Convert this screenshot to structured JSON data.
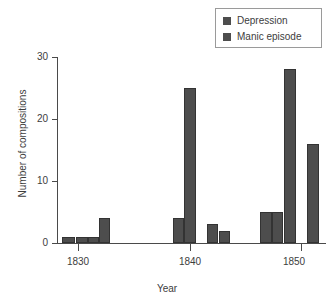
{
  "chart_data": {
    "type": "bar",
    "title": "",
    "xlabel": "Year",
    "ylabel": "Number of compositions",
    "xlim": [
      1828,
      1855
    ],
    "ylim": [
      0,
      30
    ],
    "yticks": [
      0,
      10,
      20,
      30
    ],
    "ytick_labels": [
      "0",
      "10",
      "20",
      "30"
    ],
    "xticks": [
      1830,
      1840,
      1850
    ],
    "xtick_labels": [
      "1830",
      "1840",
      "1850"
    ],
    "grid": false,
    "legend_position": "top-right",
    "legend": [
      "Depression",
      "Manic episode"
    ],
    "series": [
      {
        "name": "Depression",
        "color": "#4d4d4d",
        "points": [
          {
            "x": 1829,
            "value": 1
          },
          {
            "x": 1830,
            "value": 1
          },
          {
            "x": 1831,
            "value": 1
          },
          {
            "x": 1839,
            "value": 4
          },
          {
            "x": 1842,
            "value": 3
          },
          {
            "x": 1843,
            "value": 2
          },
          {
            "x": 1848,
            "value": 5
          },
          {
            "x": 1849,
            "value": 5
          }
        ]
      },
      {
        "name": "Manic episode",
        "color": "#4d4d4d",
        "points": [
          {
            "x": 1832,
            "value": 4
          },
          {
            "x": 1840,
            "value": 25
          },
          {
            "x": 1850,
            "value": 28
          },
          {
            "x": 1852,
            "value": 16
          }
        ]
      }
    ],
    "bars": [
      {
        "series": "Depression",
        "year": 1829,
        "value": 1,
        "left": 62,
        "width": 13
      },
      {
        "series": "Depression",
        "year": 1830,
        "value": 1,
        "left": 76,
        "width": 12
      },
      {
        "series": "Depression",
        "year": 1831,
        "value": 1,
        "left": 88,
        "width": 11
      },
      {
        "series": "Manic episode",
        "year": 1832,
        "value": 4,
        "left": 99,
        "width": 11
      },
      {
        "series": "Depression",
        "year": 1839,
        "value": 4,
        "left": 173,
        "width": 11
      },
      {
        "series": "Manic episode",
        "year": 1840,
        "value": 25,
        "left": 184,
        "width": 12
      },
      {
        "series": "Depression",
        "year": 1842,
        "value": 3,
        "left": 207,
        "width": 11
      },
      {
        "series": "Depression",
        "year": 1843,
        "value": 2,
        "left": 219,
        "width": 11
      },
      {
        "series": "Depression",
        "year": 1848,
        "value": 5,
        "left": 260,
        "width": 12
      },
      {
        "series": "Depression",
        "year": 1849,
        "value": 5,
        "left": 272,
        "width": 11
      },
      {
        "series": "Manic episode",
        "year": 1850,
        "value": 28,
        "left": 284,
        "width": 12
      },
      {
        "series": "Manic episode",
        "year": 1852,
        "value": 16,
        "left": 307,
        "width": 12
      }
    ]
  },
  "axes": {
    "y_title": "Number of compositions",
    "x_title": "Year",
    "y_tick_labels": [
      "30",
      "20",
      "10",
      "0"
    ],
    "x_tick_labels": [
      "1830",
      "1840",
      "1850"
    ]
  },
  "legend": {
    "items": [
      {
        "label": "Depression",
        "color": "#4d4d4d"
      },
      {
        "label": "Manic episode",
        "color": "#4d4d4d"
      }
    ]
  }
}
